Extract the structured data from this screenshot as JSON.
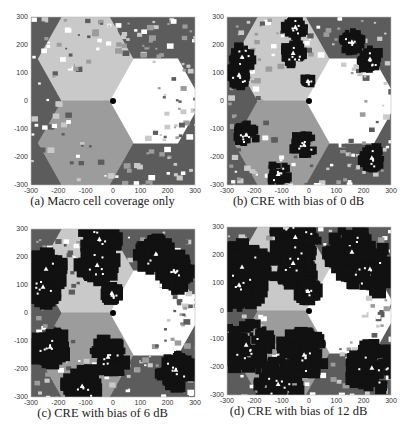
{
  "figure": {
    "panels": [
      {
        "id": "a",
        "caption": "(a) Macro cell coverage only",
        "bias_db": null,
        "blob_scale": 0
      },
      {
        "id": "b",
        "caption": "(b) CRE with bias of 0 dB",
        "bias_db": 0,
        "blob_scale": 1.0
      },
      {
        "id": "c",
        "caption": "(c) CRE with bias of 6 dB",
        "bias_db": 6,
        "blob_scale": 1.6
      },
      {
        "id": "d",
        "caption": "(d) CRE with bias of 12 dB",
        "bias_db": 12,
        "blob_scale": 2.2
      }
    ],
    "xticks": [
      "-300",
      "-200",
      "-100",
      "0",
      "100",
      "200",
      "300"
    ],
    "yticks": [
      "300",
      "200",
      "100",
      "0",
      "-100",
      "-200",
      "-300"
    ]
  },
  "colors": {
    "outer_macro": "#5c5c5c",
    "sector_upper_left": "#c9c9c9",
    "sector_lower_left": "#9c9c9c",
    "sector_right": "#ffffff",
    "pico_coverage": "#111111",
    "pico_marker": "#ffffff",
    "macro_bs": "#000000"
  },
  "chart_data": {
    "type": "heatmap",
    "xlabel": "x (m)",
    "ylabel": "y (m)",
    "xlim": [
      -300,
      300
    ],
    "ylim": [
      -300,
      300
    ],
    "grid": false,
    "legend": null,
    "macro_base_station": {
      "x": 0,
      "y": 0
    },
    "macro_sectors": [
      {
        "name": "upper-left sector",
        "shade": "light gray"
      },
      {
        "name": "lower-left sector",
        "shade": "medium gray"
      },
      {
        "name": "right sector",
        "shade": "white"
      },
      {
        "name": "neighboring macro cells",
        "shade": "dark gray"
      }
    ],
    "pico_cells": [
      {
        "x": -50,
        "y": 264
      },
      {
        "x": -245,
        "y": 157
      },
      {
        "x": -256,
        "y": 93
      },
      {
        "x": -58,
        "y": 171
      },
      {
        "x": 157,
        "y": 211
      },
      {
        "x": 223,
        "y": 150
      },
      {
        "x": -4,
        "y": 71
      },
      {
        "x": -230,
        "y": -121
      },
      {
        "x": -18,
        "y": -157
      },
      {
        "x": -113,
        "y": -261
      },
      {
        "x": 230,
        "y": -203
      }
    ],
    "series": [
      {
        "name": "(a) Macro cell coverage only",
        "pico_bias_db": null,
        "pico_coverage": "none"
      },
      {
        "name": "(b) CRE with bias of 0 dB",
        "pico_bias_db": 0,
        "pico_coverage": "small"
      },
      {
        "name": "(c) CRE with bias of 6 dB",
        "pico_bias_db": 6,
        "pico_coverage": "medium"
      },
      {
        "name": "(d) CRE with bias of 12 dB",
        "pico_bias_db": 12,
        "pico_coverage": "large"
      }
    ]
  }
}
